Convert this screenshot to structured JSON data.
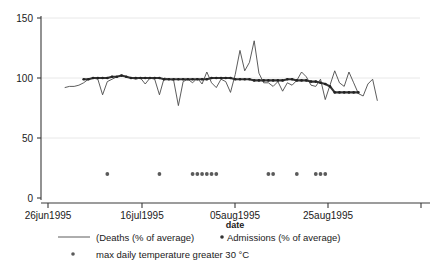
{
  "chart_data": {
    "type": "line",
    "title": "",
    "xlabel": "date",
    "ylabel": "",
    "ylim": [
      0,
      150
    ],
    "yticks": [
      0,
      50,
      100,
      150
    ],
    "ytick_labels": [
      "0",
      "50",
      "100",
      "150"
    ],
    "xtick_labels": [
      "26jun1995",
      "16jul1995",
      "05aug1995",
      "25aug1995"
    ],
    "xtick_positions": [
      0,
      20,
      40,
      60
    ],
    "xlim": [
      0,
      80
    ],
    "grid": "horizontal-faint",
    "legend_position": "bottom",
    "series": [
      {
        "name": "(Deaths (% of average)",
        "style": "thin-line",
        "x": [
          5,
          6,
          7,
          8,
          9,
          10,
          11,
          12,
          13,
          14,
          15,
          16,
          17,
          18,
          19,
          20,
          21,
          22,
          23,
          24,
          25,
          26,
          27,
          28,
          29,
          30,
          31,
          32,
          33,
          34,
          35,
          36,
          37,
          38,
          39,
          40,
          41,
          42,
          43,
          44,
          45,
          46,
          47,
          48,
          49,
          50,
          51,
          52,
          53,
          54,
          55,
          56,
          57,
          58,
          59,
          60,
          61,
          62,
          63,
          64,
          65,
          66,
          67,
          68,
          69,
          70,
          71
        ],
        "values": [
          92,
          93,
          93,
          94,
          96,
          99,
          100,
          99,
          86,
          97,
          99,
          101,
          102,
          101,
          100,
          99,
          100,
          95,
          100,
          99,
          86,
          100,
          99,
          98,
          77,
          97,
          99,
          96,
          100,
          95,
          105,
          96,
          92,
          99,
          97,
          88,
          103,
          123,
          106,
          113,
          131,
          104,
          96,
          96,
          93,
          97,
          89,
          96,
          94,
          98,
          105,
          101,
          94,
          93,
          99,
          82,
          94,
          106,
          96,
          93,
          105,
          96,
          87,
          85,
          95,
          99,
          81
        ]
      },
      {
        "name": "Admissions (% of average)",
        "style": "thick-dotted-line",
        "x": [
          9,
          10,
          11,
          12,
          13,
          14,
          15,
          16,
          17,
          18,
          19,
          20,
          21,
          22,
          23,
          24,
          25,
          26,
          27,
          28,
          29,
          30,
          31,
          32,
          33,
          34,
          35,
          36,
          37,
          38,
          39,
          40,
          41,
          42,
          43,
          44,
          45,
          46,
          47,
          48,
          49,
          50,
          51,
          52,
          53,
          54,
          55,
          56,
          57,
          58,
          59,
          60,
          61,
          62,
          63,
          64,
          65,
          66,
          67
        ],
        "values": [
          99,
          99,
          100,
          100,
          100,
          100,
          101,
          101,
          102,
          101,
          100,
          100,
          100,
          100,
          100,
          100,
          100,
          99,
          99,
          99,
          99,
          99,
          99,
          99,
          99,
          99,
          99,
          100,
          100,
          100,
          100,
          100,
          99,
          99,
          99,
          99,
          98,
          98,
          98,
          98,
          98,
          98,
          98,
          99,
          99,
          98,
          98,
          98,
          97,
          97,
          96,
          95,
          93,
          88,
          88,
          88,
          88,
          88,
          88
        ]
      },
      {
        "name": "max daily temperature greater 30 °C",
        "style": "dot-markers",
        "y_level": 20,
        "x": [
          14,
          25,
          32,
          33,
          34,
          35,
          36,
          37,
          48,
          49,
          54,
          58,
          59,
          60
        ]
      }
    ],
    "legend": [
      {
        "label": "(Deaths (% of average)",
        "marker": "line"
      },
      {
        "label": "Admissions (% of average)",
        "marker": "dot"
      },
      {
        "label": "max daily temperature greater 30 °C",
        "marker": "dot"
      }
    ]
  },
  "axis": {
    "y_tick_0": "0",
    "y_tick_50": "50",
    "y_tick_100": "100",
    "y_tick_150": "150",
    "x_tick_1": "26jun1995",
    "x_tick_2": "16jul1995",
    "x_tick_3": "05aug1995",
    "x_tick_4": "25aug1995",
    "x_title": "date"
  },
  "legend": {
    "deaths_label": "(Deaths (% of average)",
    "admissions_label": "Admissions (% of average)",
    "temperature_label": "max daily temperature greater 30 °C"
  },
  "colors": {
    "axis": "#3a3a3a",
    "grid": "#e6e6e6",
    "deaths_line": "#4a4a4a",
    "admissions_line": "#3a3a3a",
    "temperature_dot": "#5a5a5a"
  }
}
